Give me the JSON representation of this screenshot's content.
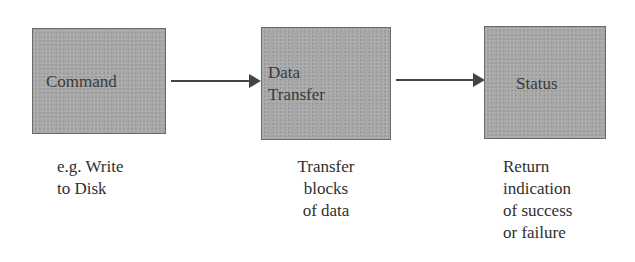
{
  "diagram": {
    "type": "flow",
    "direction": "left-to-right",
    "colors": {
      "box_fill": "#a9a9a9",
      "box_border": "#6a6a6a",
      "arrow": "#444444",
      "text": "#333333"
    },
    "steps": [
      {
        "label_lines": [
          "Command"
        ],
        "caption_lines": [
          "e.g. Write",
          "to Disk"
        ]
      },
      {
        "label_lines": [
          "Data",
          "Transfer"
        ],
        "caption_lines": [
          "Transfer",
          "blocks",
          "of data"
        ]
      },
      {
        "label_lines": [
          "Status"
        ],
        "caption_lines": [
          "Return",
          "indication",
          "of success",
          "or failure"
        ]
      }
    ],
    "arrows": [
      {
        "from": "Command",
        "to": "Data Transfer"
      },
      {
        "from": "Data Transfer",
        "to": "Status"
      }
    ]
  }
}
